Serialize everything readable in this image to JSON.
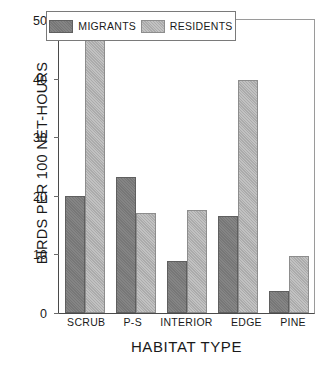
{
  "chart_data": {
    "type": "bar",
    "title": "",
    "xlabel": "HABITAT TYPE",
    "ylabel": "BIRDS PER 100 NET-HOURS",
    "categories": [
      "SCRUB",
      "P-S",
      "INTERIOR",
      "EDGE",
      "PINE"
    ],
    "series": [
      {
        "name": "MIGRANTS",
        "color": "#7d7d7d",
        "values": [
          20.0,
          23.2,
          8.8,
          16.6,
          3.8
        ]
      },
      {
        "name": "RESIDENTS",
        "color": "#b4b4b4",
        "values": [
          48.0,
          17.1,
          17.5,
          39.7,
          9.7
        ]
      }
    ],
    "ylim": [
      0,
      50
    ],
    "yticks": [
      0,
      10,
      20,
      30,
      40,
      50
    ],
    "ytick_labels": [
      "0",
      "10",
      "20",
      "30",
      "40",
      "50"
    ],
    "grid": false,
    "legend_position": "top-center"
  },
  "legend": {
    "entries": [
      {
        "label": "MIGRANTS"
      },
      {
        "label": "RESIDENTS"
      }
    ]
  }
}
